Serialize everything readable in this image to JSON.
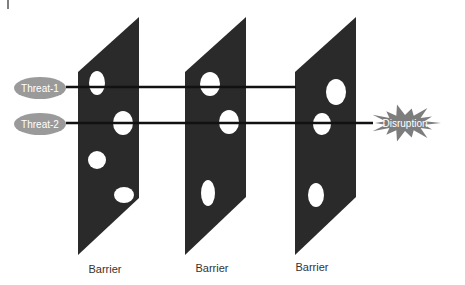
{
  "diagram": {
    "type": "swiss-cheese-model",
    "threats": [
      {
        "label": "Threat-1",
        "cx": 40,
        "cy": 88,
        "line_y": 87,
        "line_end_x": 296
      },
      {
        "label": "Threat-2",
        "cx": 40,
        "cy": 124,
        "line_y": 123,
        "line_end_x": 373
      }
    ],
    "barriers": [
      {
        "label": "Barrier",
        "points": "78,72 139,17 139,198 78,255",
        "label_x": 105,
        "label_y": 273,
        "holes": [
          {
            "cx": 97,
            "cy": 83,
            "rx": 8,
            "ry": 12
          },
          {
            "cx": 123,
            "cy": 123,
            "rx": 10,
            "ry": 12
          },
          {
            "cx": 97,
            "cy": 160,
            "rx": 9,
            "ry": 9
          },
          {
            "cx": 124,
            "cy": 195,
            "rx": 10,
            "ry": 8
          }
        ]
      },
      {
        "label": "Barrier",
        "points": "185,72 246,17 246,197 185,255",
        "label_x": 212,
        "label_y": 272,
        "holes": [
          {
            "cx": 210,
            "cy": 84,
            "rx": 10,
            "ry": 12
          },
          {
            "cx": 229,
            "cy": 122,
            "rx": 10,
            "ry": 12
          },
          {
            "cx": 208,
            "cy": 193,
            "rx": 7,
            "ry": 13
          }
        ]
      },
      {
        "label": "Barrier",
        "points": "295,72 356,17 356,197 295,255",
        "label_x": 312,
        "label_y": 271,
        "holes": [
          {
            "cx": 336,
            "cy": 92,
            "rx": 10,
            "ry": 13
          },
          {
            "cx": 322,
            "cy": 124,
            "rx": 9,
            "ry": 11
          },
          {
            "cx": 316,
            "cy": 195,
            "rx": 8,
            "ry": 12
          }
        ]
      }
    ],
    "outcome": {
      "label": "Disruption",
      "cx": 405,
      "cy": 123
    },
    "colors": {
      "barrier": "#2a2a2a",
      "threat_fill": "#9a9a9a",
      "threat_text": "#ffffff",
      "star_fill": "#7d7d7d",
      "line": "#111111",
      "label_text": "#333333"
    }
  }
}
